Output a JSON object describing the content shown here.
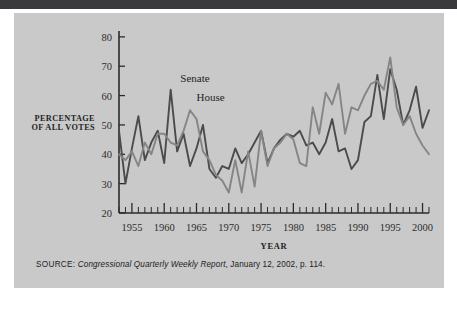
{
  "figure": {
    "source_kicker": "SOURCE:",
    "source_title": "Congressional Quarterly Weekly Report",
    "source_rest": ", January 12, 2002, p. 114."
  },
  "chart_data": {
    "type": "line",
    "title": "",
    "xlabel": "YEAR",
    "ylabel": "PERCENTAGE OF ALL VOTES",
    "xlim": [
      1953,
      2001
    ],
    "ylim": [
      20,
      82
    ],
    "yticks": [
      20,
      30,
      40,
      50,
      60,
      70,
      80
    ],
    "xticks": [
      1955,
      1960,
      1965,
      1970,
      1975,
      1980,
      1985,
      1990,
      1995,
      2000
    ],
    "xtick_labels": [
      "1955",
      "1960",
      "1965",
      "1970",
      "1975",
      "1980",
      "1985",
      "1990",
      "1995",
      "2000"
    ],
    "ytick_labels": [
      "20",
      "30",
      "40",
      "50",
      "60",
      "70",
      "80"
    ],
    "minor_xtick_step": 1,
    "grid": false,
    "legend_position": "inline-annotation",
    "colors": {
      "senate": "#4b4b4b",
      "house": "#858585",
      "axis": "#2b2b2b",
      "panel_background": "#c9c9c9",
      "page_background": "#ffffff",
      "top_rule": "#3a3a3c"
    },
    "annotations": [
      {
        "text": "Senate",
        "x": 1962.5,
        "y": 64.5
      },
      {
        "text": "House",
        "x": 1965.0,
        "y": 58.0
      }
    ],
    "x": [
      1953,
      1954,
      1955,
      1956,
      1957,
      1958,
      1959,
      1960,
      1961,
      1962,
      1963,
      1964,
      1965,
      1966,
      1967,
      1968,
      1969,
      1970,
      1971,
      1972,
      1973,
      1974,
      1975,
      1976,
      1977,
      1978,
      1979,
      1980,
      1981,
      1982,
      1983,
      1984,
      1985,
      1986,
      1987,
      1988,
      1989,
      1990,
      1991,
      1992,
      1993,
      1994,
      1995,
      1996,
      1997,
      1998,
      1999,
      2000,
      2001
    ],
    "series": [
      {
        "name": "Senate",
        "label": "Senate",
        "color": "#4b4b4b",
        "values": [
          48,
          30,
          42,
          53,
          38,
          44,
          48,
          37,
          62,
          41,
          47,
          36,
          42,
          50,
          35,
          32,
          36,
          35,
          42,
          37,
          40,
          44,
          48,
          37,
          42,
          45,
          47,
          46,
          48,
          43,
          44,
          40,
          44,
          52,
          41,
          42,
          35,
          38,
          51,
          53,
          67,
          52,
          69,
          62,
          50,
          55,
          63,
          49,
          55
        ]
      },
      {
        "name": "House",
        "label": "House",
        "color": "#858585",
        "values": [
          40,
          38,
          41,
          36,
          44,
          40,
          47,
          47,
          44,
          43,
          48,
          55,
          52,
          41,
          38,
          33,
          31,
          27,
          38,
          27,
          41,
          29,
          48,
          36,
          42,
          44,
          47,
          45,
          37,
          36,
          56,
          47,
          61,
          57,
          64,
          47,
          56,
          55,
          60,
          64,
          65,
          62,
          73,
          56,
          50,
          53,
          47,
          43,
          40
        ]
      }
    ]
  }
}
